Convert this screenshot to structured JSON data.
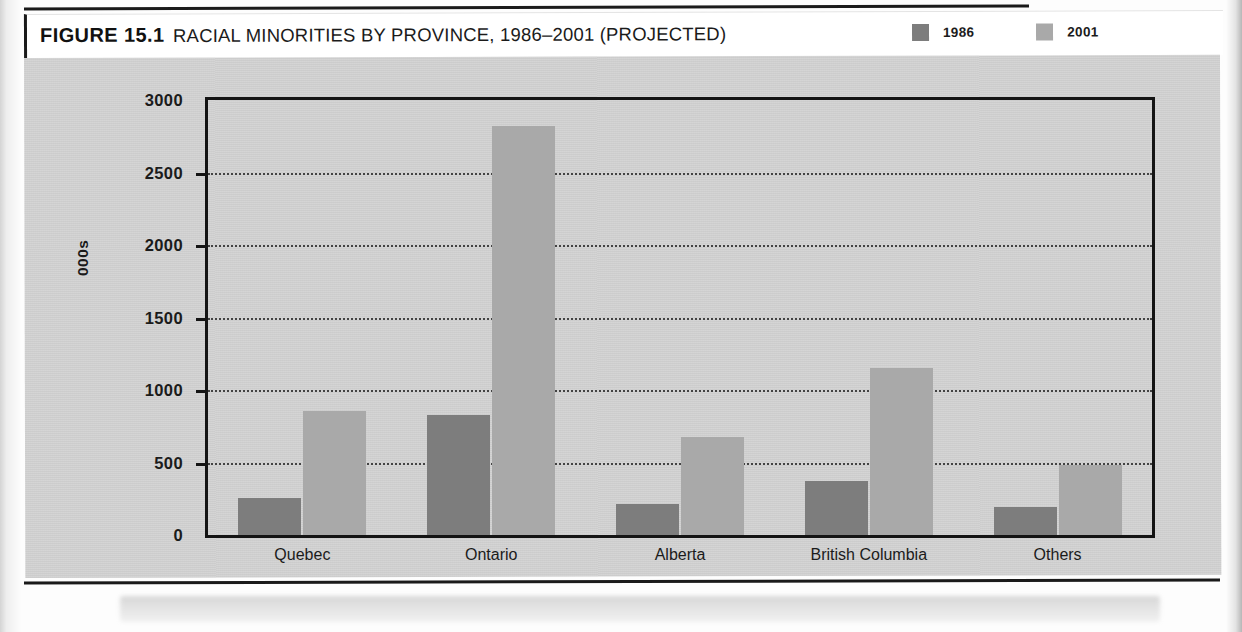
{
  "figure": {
    "label": "FIGURE 15.1",
    "title": "RACIAL MINORITIES BY PROVINCE, 1986–2001 (PROJECTED)"
  },
  "legend": {
    "position": "top-right",
    "items": [
      {
        "label": "1986",
        "color": "#7d7d7d"
      },
      {
        "label": "2001",
        "color": "#a9a9a9"
      }
    ]
  },
  "axes": {
    "y_title": "000s",
    "y_ticks": [
      "0",
      "500",
      "1000",
      "1500",
      "2000",
      "2500",
      "3000"
    ]
  },
  "colors": {
    "series_1986": "#7d7d7d",
    "series_2001": "#a9a9a9",
    "plate_background": "#d3d3d3",
    "axis": "#141414",
    "text": "#1b1b1b"
  },
  "chart_data": {
    "type": "bar",
    "title": "RACIAL MINORITIES BY PROVINCE, 1986–2001 (PROJECTED)",
    "xlabel": "",
    "ylabel": "000s",
    "ylim": [
      0,
      3000
    ],
    "ytick_step": 500,
    "grid": true,
    "legend_position": "top-right",
    "categories": [
      "Quebec",
      "Ontario",
      "Alberta",
      "British Columbia",
      "Others"
    ],
    "series": [
      {
        "name": "1986",
        "color": "#7d7d7d",
        "values": [
          255,
          830,
          215,
          375,
          190
        ]
      },
      {
        "name": "2001",
        "color": "#a9a9a9",
        "values": [
          855,
          2820,
          675,
          1150,
          480
        ]
      }
    ],
    "units": "thousands of persons",
    "annotations": []
  }
}
